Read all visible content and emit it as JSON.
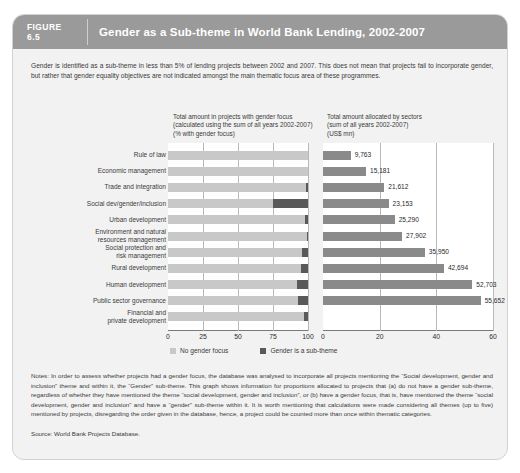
{
  "figure": {
    "label": "FIGURE",
    "number": "6.5",
    "title": "Gender as a Sub-theme in World Bank Lending, 2002-2007"
  },
  "intro": "Gender is identified as a sub-theme in less than 5% of lending projects between 2002 and 2007. This does not mean that projects fail to incorporate gender, but rather that gender equality objectives are not indicated amongst the main thematic focus area of these programmes.",
  "notes": "Notes: In order to assess whether projects had a gender focus, the database was analysed to incorporate all projects mentioning the “Social development, gender and inclusion” theme and within it, the “Gender” sub-theme. This graph shows information for proportions allocated to projects that (a) do not have a gender sub-theme, regardless of whether they have mentioned the theme “social development, gender and inclusion”, or (b) have a gender focus, that is, have mentioned the theme “social development, gender and inclusion” and have a “gender” sub-theme within it. It is worth mentioning that calculations were made considering all themes (up to five) mentioned by projects, disregarding the order given in the database, hence, a project could be counted more than once within thematic categories.",
  "source": "Source: World Bank Projects Database.",
  "legend": {
    "no_gender_focus": "No gender focus",
    "gender_sub_theme": "Gender is a sub-theme",
    "color_light": "#c8c8c8",
    "color_dark": "#595959"
  },
  "chart_data": [
    {
      "type": "bar",
      "orientation": "horizontal",
      "stacked": true,
      "title": "Total amount in projects with gender focus (calculated using the sum of all years 2002-2007) (% with gender focus)",
      "title_lines": [
        "Total amount in projects with gender focus",
        "(calculated using the sum of all years 2002-2007)",
        "(% with gender focus)"
      ],
      "xlabel": "",
      "ylabel": "",
      "xlim": [
        0,
        100
      ],
      "xticks": [
        0,
        25,
        50,
        75,
        100
      ],
      "grid": true,
      "legend_position": "bottom",
      "categories": [
        "Rule of law",
        "Economic management",
        "Trade and integration",
        "Social dev/gender/inclusion",
        "Urban development",
        "Environment and natural resources management",
        "Social protection and risk management",
        "Rural development",
        "Human development",
        "Public sector governance",
        "Financial and private development"
      ],
      "series": [
        {
          "name": "No gender focus",
          "color": "#c8c8c8",
          "values": [
            100,
            100,
            98.5,
            75,
            98,
            99,
            95.5,
            95,
            92,
            92.5,
            97
          ]
        },
        {
          "name": "Gender is a sub-theme",
          "color": "#595959",
          "values": [
            0,
            0,
            1.5,
            25,
            2,
            1,
            4.5,
            5,
            8,
            7.5,
            3
          ]
        }
      ]
    },
    {
      "type": "bar",
      "orientation": "horizontal",
      "stacked": false,
      "title": "Total amount allocated by sectors (sum of all years 2002-2007) (US$ mn)",
      "title_lines": [
        "Total amount allocated by sectors",
        "(sum of all years 2002-2007)",
        "(US$ mn)"
      ],
      "xlabel": "",
      "ylabel": "",
      "xlim": [
        0,
        60
      ],
      "xticks": [
        0,
        20,
        40,
        60
      ],
      "xtick_unit_scale": 1000,
      "grid": true,
      "bar_color": "#8a8a8a",
      "categories": [
        "Rule of law",
        "Economic management",
        "Trade and integration",
        "Social dev/gender/inclusion",
        "Urban development",
        "Environment and natural resources management",
        "Social protection and risk management",
        "Rural development",
        "Human development",
        "Public sector governance",
        "Financial and private development"
      ],
      "values": [
        9763,
        15181,
        21612,
        23153,
        25290,
        27902,
        35950,
        42694,
        52703,
        55652
      ],
      "value_labels": [
        "9,763",
        "15,181",
        "21,612",
        "23,153",
        "25,290",
        "27,902",
        "35,950",
        "42,694",
        "52,703",
        "55,652"
      ]
    }
  ]
}
